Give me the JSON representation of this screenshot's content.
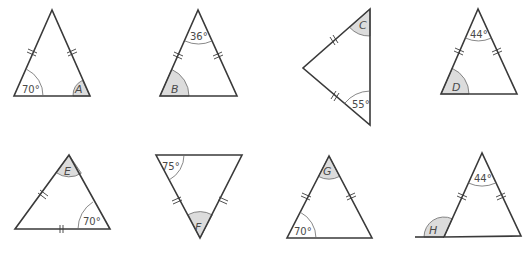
{
  "diagram": {
    "colors": {
      "line": "#3a3a3a",
      "shaded_angle": "#dcdcdc",
      "label": "#4a4a4a"
    },
    "triangles": [
      {
        "id": "A",
        "unknown": "A",
        "given_angle": "70°",
        "given_position": "base-left",
        "unknown_position": "base-right",
        "equal_sides": "two slanted sides"
      },
      {
        "id": "B",
        "unknown": "B",
        "given_angle": "36°",
        "given_position": "apex",
        "unknown_position": "base-left",
        "equal_sides": "two slanted sides"
      },
      {
        "id": "C",
        "unknown": "C",
        "given_angle": "55°",
        "given_position": "bottom",
        "unknown_position": "top",
        "equal_sides": "two left sides"
      },
      {
        "id": "D",
        "unknown": "D",
        "given_angle": "44°",
        "given_position": "apex",
        "unknown_position": "base-left",
        "equal_sides": "two slanted sides"
      },
      {
        "id": "E",
        "unknown": "E",
        "given_angle": "70°",
        "given_position": "base-right",
        "unknown_position": "apex",
        "equal_sides": "left side and base"
      },
      {
        "id": "F",
        "unknown": "F",
        "given_angle": "75°",
        "given_position": "top-left",
        "unknown_position": "bottom",
        "equal_sides": "two slanted sides"
      },
      {
        "id": "G",
        "unknown": "G",
        "given_angle": "70°",
        "given_position": "base-left",
        "unknown_position": "apex",
        "equal_sides": "two slanted sides"
      },
      {
        "id": "H",
        "unknown": "H",
        "given_angle": "44°",
        "given_position": "apex",
        "unknown_position": "exterior base-left",
        "equal_sides": "two slanted sides"
      }
    ]
  }
}
